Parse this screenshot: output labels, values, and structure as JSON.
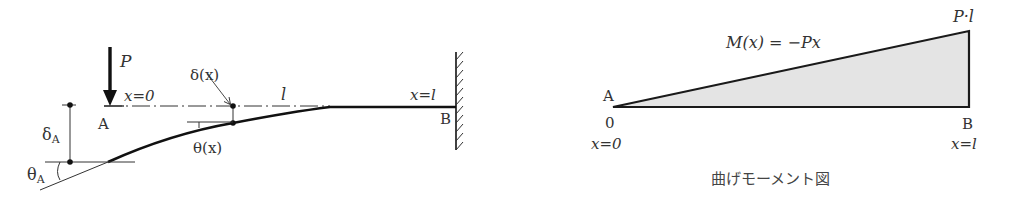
{
  "left_diagram": {
    "title": "Cantilever beam deflection",
    "load_label": "P",
    "origin_label": "x=0",
    "free_end_label": "A",
    "fixed_end_label": "B",
    "fixed_end_coord": "x=l",
    "length_label": "l",
    "deflection_at_x": "δ(x)",
    "slope_at_x": "θ(x)",
    "deflection_at_A": "δ",
    "deflection_at_A_sub": "A",
    "slope_at_A": "θ",
    "slope_at_A_sub": "A"
  },
  "right_diagram": {
    "equation": "M(x) = −Px",
    "max_value_label": "P·l",
    "left_point": "A",
    "left_value": "0",
    "left_coord": "x=0",
    "right_point": "B",
    "right_coord": "x=l",
    "caption": "曲げモーメント図",
    "fill_color": "#e4e4e4",
    "line_color": "#1a1a1a"
  }
}
